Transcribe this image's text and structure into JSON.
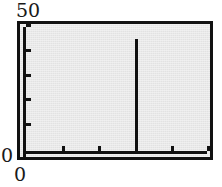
{
  "figure": {
    "background_color": "#ffffff",
    "plot_background_color": "#e2e2e2",
    "frame_color": "#111111",
    "series_color": "#111111"
  },
  "labels": {
    "y_max": "50",
    "y_min": "0",
    "x_min": "0",
    "x_max": ""
  },
  "chart_data": {
    "type": "bar",
    "title": "",
    "subtitle": "",
    "xlabel": "",
    "ylabel": "",
    "xlim": [
      0,
      100
    ],
    "ylim": [
      0,
      50
    ],
    "grid": false,
    "legend": null,
    "y_ticks": [
      0,
      10,
      20,
      30,
      40,
      50
    ],
    "y_tick_labels": [
      "0",
      "",
      "",
      "",
      "",
      "50"
    ],
    "x_ticks": [
      0,
      20,
      40,
      60,
      80,
      100
    ],
    "x_tick_labels": [
      "0",
      "",
      "",
      "",
      "",
      ""
    ],
    "x": [
      0,
      5,
      10,
      15,
      20,
      25,
      30,
      35,
      40,
      45,
      50,
      55,
      60,
      65,
      70,
      75,
      80,
      85,
      90,
      95,
      100
    ],
    "values": [
      0,
      0,
      0,
      0,
      0,
      0,
      0,
      0,
      0,
      0,
      0,
      0,
      45,
      0,
      0,
      0,
      0,
      0,
      0,
      0,
      0
    ],
    "spike": {
      "x": 60,
      "value": 45
    }
  }
}
